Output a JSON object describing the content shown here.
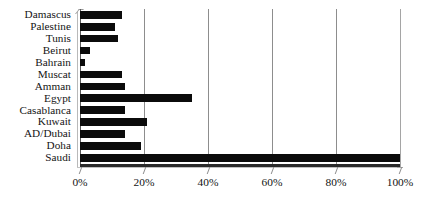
{
  "chart_data": {
    "type": "bar",
    "orientation": "horizontal",
    "title": "",
    "xlabel": "",
    "ylabel": "",
    "xlim": [
      0,
      100
    ],
    "grid": true,
    "legend": null,
    "x_tick_labels": [
      "0%",
      "20%",
      "40%",
      "60%",
      "80%",
      "100%"
    ],
    "x_ticks": [
      0,
      20,
      40,
      60,
      80,
      100
    ],
    "categories": [
      "Damascus",
      "Palestine",
      "Tunis",
      "Beirut",
      "Bahrain",
      "Muscat",
      "Amman",
      "Egypt",
      "Casablanca",
      "Kuwait",
      "AD/Dubai",
      "Doha",
      "Saudi"
    ],
    "values": [
      13,
      11,
      12,
      3,
      1.5,
      13,
      14,
      35,
      14,
      21,
      14,
      19,
      100
    ],
    "value_unit": "%",
    "bar_color": "#0b0b0b",
    "gridline_color": "#8d8d8d"
  }
}
